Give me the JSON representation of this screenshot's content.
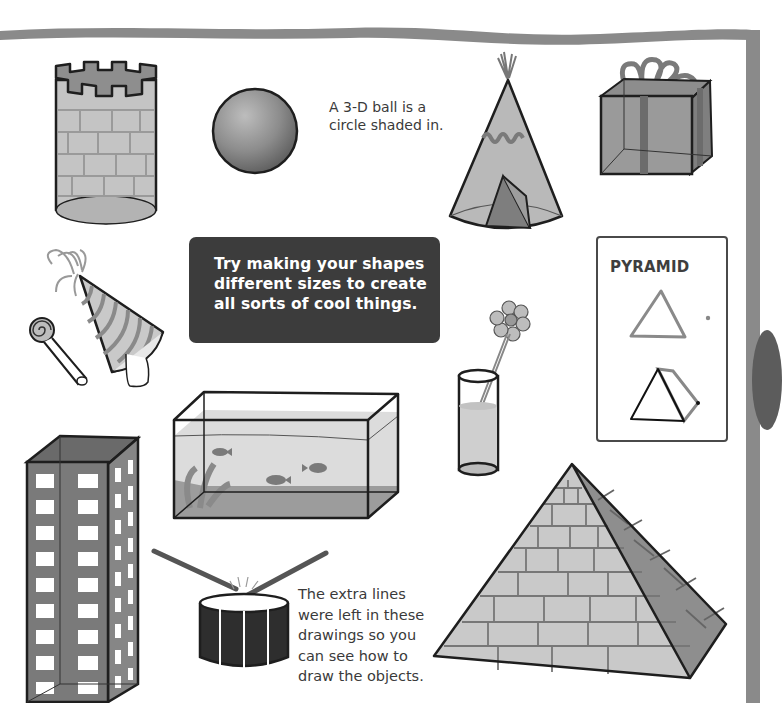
{
  "page": {
    "tip_box": {
      "lines": [
        "Try making your shapes",
        "different sizes to create",
        "all sorts of cool things."
      ]
    },
    "ball_caption": {
      "lines": [
        "A 3-D ball is a",
        "circle shaded in."
      ]
    },
    "note": {
      "lines": [
        "The extra lines",
        "were left in these",
        "drawings so you",
        "can see how to",
        "draw the objects."
      ]
    },
    "pyramid_card": {
      "title": "PYRAMID"
    },
    "illustrations": [
      "castle-tower",
      "ball",
      "tepee",
      "gift-box",
      "party-hat",
      "party-blower",
      "flower-in-glass",
      "fish-tank",
      "skyscraper",
      "drum",
      "stone-pyramid"
    ],
    "colors": {
      "frame": "#8a8a8a",
      "tip_box_bg": "#3c3c3c",
      "text": "#3a3a3a",
      "outline": "#1e1e1e"
    }
  }
}
